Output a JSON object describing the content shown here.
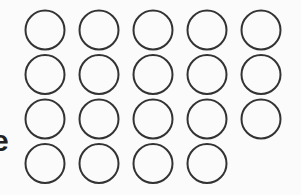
{
  "edge_text": "e",
  "circle_grid": {
    "rows": [
      5,
      5,
      5,
      4
    ],
    "total_circles": 19,
    "filled": false,
    "stroke_color": "#333333",
    "fill_color": "none"
  }
}
